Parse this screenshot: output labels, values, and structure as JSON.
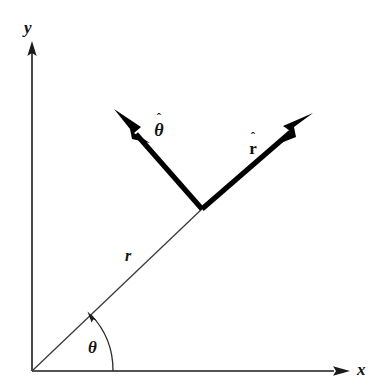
{
  "figure": {
    "background_color": "#ffffff",
    "ink_color": "#1a1a1a",
    "width": 384,
    "height": 389
  },
  "axes": {
    "origin": {
      "x": 32,
      "y": 371
    },
    "x_axis": {
      "label": "x",
      "from": {
        "x": 32,
        "y": 371
      },
      "to": {
        "x": 345,
        "y": 371
      },
      "arrow_tip": {
        "x": 350,
        "y": 371
      },
      "label_pos": {
        "x": 357,
        "y": 361
      }
    },
    "y_axis": {
      "label": "y",
      "from": {
        "x": 32,
        "y": 371
      },
      "to": {
        "x": 32,
        "y": 48
      },
      "arrow_tip": {
        "x": 32,
        "y": 42
      },
      "label_pos": {
        "x": 24,
        "y": 19
      }
    }
  },
  "radial": {
    "label": "r",
    "label_pos": {
      "x": 125,
      "y": 248
    },
    "from": {
      "x": 32,
      "y": 371
    },
    "to": {
      "x": 202,
      "y": 209
    },
    "angle_degrees": 43.6,
    "length_px": 234
  },
  "angle_arc": {
    "label": "θ",
    "label_pos": {
      "x": 88,
      "y": 339
    },
    "radius_px": 81,
    "start_on_axis": {
      "x": 113,
      "y": 371
    },
    "end_on_radial": {
      "x": 91,
      "y": 315
    },
    "sweep_start_degrees": 0,
    "sweep_end_degrees": 43.6,
    "has_arrowhead": true
  },
  "unit_vectors": [
    {
      "name": "r-hat",
      "label_symbol": "r",
      "label_accent": "ˆ",
      "origin": {
        "x": 202,
        "y": 209
      },
      "tip": {
        "x": 312,
        "y": 114
      },
      "direction_degrees": 40.8,
      "label_pos": {
        "x": 244,
        "y": 133
      },
      "style": "bold-roman"
    },
    {
      "name": "theta-hat",
      "label_symbol": "θ",
      "label_accent": "ˆ",
      "origin": {
        "x": 202,
        "y": 209
      },
      "tip": {
        "x": 115,
        "y": 110
      },
      "direction_degrees": 131.3,
      "label_pos": {
        "x": 148,
        "y": 114
      },
      "style": "bold-italic"
    }
  ]
}
